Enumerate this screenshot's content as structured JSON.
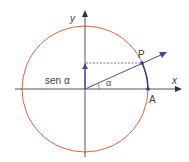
{
  "diagram": {
    "labels": {
      "y_axis": "y",
      "x_axis": "x",
      "point_p": "P",
      "point_a": "A",
      "angle": "α",
      "sine": "sen α"
    },
    "colors": {
      "circle": "#e06048",
      "axes": "#555555",
      "vector": "#4a4a9a",
      "arc": "#3a3a8a",
      "text": "#444444"
    },
    "geometry": {
      "center": [
        85,
        89
      ],
      "radius": 63,
      "point_p": [
        142,
        63
      ],
      "point_a": [
        148,
        89
      ],
      "sine_height": [
        85,
        63
      ]
    }
  }
}
